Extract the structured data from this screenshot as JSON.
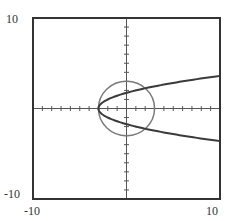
{
  "chart_data": {
    "type": "line",
    "title": "",
    "xlabel": "",
    "ylabel": "",
    "xlim": [
      -10,
      10
    ],
    "ylim": [
      -10,
      10
    ],
    "grid": false,
    "tick_step": 1,
    "tick_labels": {
      "y_top": "10",
      "y_bottom": "-10",
      "x_left": "-10",
      "x_right": "10"
    },
    "series": [
      {
        "name": "circle",
        "equation": "x^2 + y^2 = 9",
        "kind": "circle",
        "center": [
          0,
          0
        ],
        "radius": 3,
        "color": "#7a7a7a"
      },
      {
        "name": "parabola",
        "equation": "x = y^2 - 3",
        "kind": "sideways-parabola",
        "vertex": [
          -3,
          0
        ],
        "points_upper": [
          [
            -3,
            0
          ],
          [
            -2,
            1
          ],
          [
            1,
            2
          ],
          [
            6,
            3
          ],
          [
            10,
            3.61
          ]
        ],
        "points_lower": [
          [
            -3,
            0
          ],
          [
            -2,
            -1
          ],
          [
            1,
            -2
          ],
          [
            6,
            -3
          ],
          [
            10,
            -3.61
          ]
        ],
        "color": "#3a3a3a"
      }
    ]
  },
  "colors": {
    "frame": "#333333",
    "axis": "#555555",
    "circle": "#7a7a7a",
    "parabola": "#3a3a3a"
  }
}
